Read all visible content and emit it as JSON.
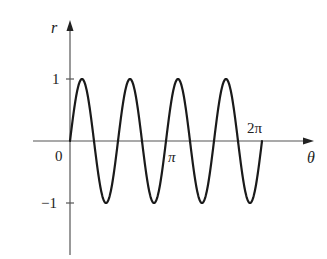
{
  "chart_data": {
    "type": "line",
    "title": "",
    "function": "r = sin(4θ)",
    "xlabel": "θ",
    "ylabel": "r",
    "x_ticks": [
      {
        "value": 0,
        "label": "0"
      },
      {
        "value": 3.14159,
        "label": "π"
      },
      {
        "value": 6.28318,
        "label": "2π"
      }
    ],
    "y_ticks": [
      {
        "value": 1,
        "label": "1"
      },
      {
        "value": -1,
        "label": "−1"
      }
    ],
    "xlim": [
      0,
      6.28318
    ],
    "ylim": [
      -1,
      1
    ],
    "grid": false,
    "legend": null,
    "series": [
      {
        "name": "r = sin 4θ",
        "x": [
          0,
          0.3927,
          0.7854,
          1.1781,
          1.5708,
          1.9635,
          2.3562,
          2.7489,
          3.1416,
          3.5343,
          3.927,
          4.3197,
          4.7124,
          5.1051,
          5.4978,
          5.8905,
          6.2832
        ],
        "values": [
          0,
          1,
          0,
          -1,
          0,
          1,
          0,
          -1,
          0,
          1,
          0,
          -1,
          0,
          1,
          0,
          -1,
          0
        ]
      }
    ],
    "color": "#1a1a1a"
  },
  "labels": {
    "r_axis": "r",
    "theta_axis": "θ",
    "origin": "0",
    "pi": "π",
    "two_pi": "2π",
    "one": "1",
    "neg_one": "−1"
  }
}
